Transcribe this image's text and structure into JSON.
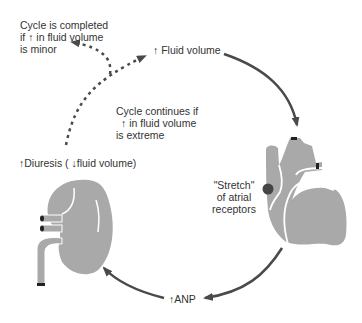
{
  "diagram": {
    "labels": {
      "cycle_completed": [
        "Cycle is completed",
        "if ↑ in fluid volume",
        "is minor"
      ],
      "fluid_volume": "↑ Fluid volume",
      "cycle_continues": [
        "Cycle continues if",
        "↑ in fluid volume",
        "is extreme"
      ],
      "stretch": [
        "\"Stretch\"",
        "of atrial",
        "receptors"
      ],
      "anp": "↑ANP",
      "diuresis": "↑Diuresis ( ↓fluid volume)"
    },
    "colors": {
      "organ_fill": "#a9a9a9",
      "arrow": "#4a4a4a",
      "text": "#333333",
      "receptor_dot": "#444444"
    },
    "nodes": [
      "Fluid volume",
      "Heart (atrial stretch receptors)",
      "ANP",
      "Kidney (diuresis)"
    ]
  }
}
